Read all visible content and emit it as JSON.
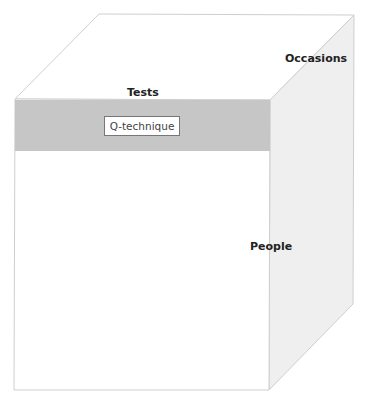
{
  "diagram": {
    "type": "data-cube",
    "faces": {
      "top_label": "Tests",
      "side_label": "Occasions",
      "front_label": "People"
    },
    "slice": {
      "label": "Q-technique",
      "color": "#c6c6c6"
    },
    "colors": {
      "top_face": "#ffffff",
      "side_face": "#efefef",
      "front_face": "#ffffff",
      "edge": "#cfcfcf"
    }
  }
}
